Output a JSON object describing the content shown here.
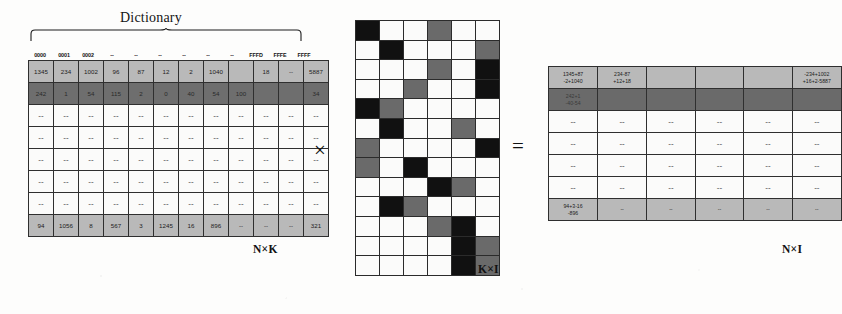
{
  "figure": {
    "dictionary_caption": "Dictionary",
    "operator_times": "×",
    "operator_equals": "="
  },
  "left_matrix": {
    "name": "code-occurrence-matrix",
    "dimension_label": "N×K",
    "column_headers": [
      "0000",
      "0001",
      "0002",
      "--",
      "--",
      "--",
      "--",
      "--",
      "--",
      "FFFD",
      "FFFE",
      "FFFF"
    ],
    "rows": [
      {
        "style": "light",
        "cells": [
          "1345",
          "234",
          "1002",
          "96",
          "87",
          "12",
          "2",
          "1040",
          "",
          "18",
          "--",
          "5887"
        ]
      },
      {
        "style": "dark",
        "cells": [
          "242",
          "1",
          "54",
          "115",
          "2",
          "0",
          "40",
          "54",
          "100",
          "",
          "",
          "34"
        ]
      },
      {
        "style": "dots",
        "cells": [
          "--",
          "--",
          "--",
          "--",
          "--",
          "--",
          "--",
          "--",
          "--",
          "--",
          "--",
          "--"
        ]
      },
      {
        "style": "dots",
        "cells": [
          "--",
          "--",
          "--",
          "--",
          "--",
          "--",
          "--",
          "--",
          "--",
          "--",
          "--",
          "--"
        ]
      },
      {
        "style": "dots",
        "cells": [
          "--",
          "--",
          "--",
          "--",
          "--",
          "--",
          "--",
          "--",
          "--",
          "--",
          "--",
          "--"
        ]
      },
      {
        "style": "dots",
        "cells": [
          "--",
          "--",
          "--",
          "--",
          "--",
          "--",
          "--",
          "--",
          "--",
          "--",
          "--",
          "--"
        ]
      },
      {
        "style": "dots",
        "cells": [
          "--",
          "--",
          "--",
          "--",
          "--",
          "--",
          "--",
          "--",
          "--",
          "--",
          "--",
          "--"
        ]
      },
      {
        "style": "light",
        "cells": [
          "94",
          "1056",
          "8",
          "567",
          "3",
          "1245",
          "16",
          "896",
          "--",
          "--",
          "--",
          "321"
        ]
      }
    ]
  },
  "middle_matrix": {
    "name": "binary-projection-matrix",
    "dimension_label": "K×I",
    "legend": {
      "white": "0",
      "black": "1",
      "gray": "shaded"
    },
    "colors": {
      "white": "#fbfbfa",
      "black": "#111111",
      "gray": "#6a6a6a"
    },
    "grid": [
      [
        "k",
        "w",
        "w",
        "g",
        "w",
        "w"
      ],
      [
        "w",
        "k",
        "w",
        "w",
        "w",
        "g"
      ],
      [
        "w",
        "w",
        "w",
        "g",
        "w",
        "k"
      ],
      [
        "w",
        "w",
        "g",
        "w",
        "w",
        "k"
      ],
      [
        "k",
        "g",
        "w",
        "w",
        "w",
        "w"
      ],
      [
        "w",
        "k",
        "w",
        "w",
        "g",
        "w"
      ],
      [
        "g",
        "w",
        "w",
        "w",
        "w",
        "k"
      ],
      [
        "g",
        "w",
        "k",
        "w",
        "w",
        "w"
      ],
      [
        "w",
        "w",
        "w",
        "k",
        "g",
        "w"
      ],
      [
        "w",
        "k",
        "g",
        "w",
        "w",
        "w"
      ],
      [
        "w",
        "w",
        "w",
        "g",
        "k",
        "w"
      ],
      [
        "w",
        "w",
        "w",
        "w",
        "k",
        "g"
      ],
      [
        "w",
        "w",
        "w",
        "w",
        "k",
        "g"
      ]
    ]
  },
  "right_matrix": {
    "name": "product-matrix",
    "dimension_label": "N×I",
    "rows": [
      {
        "style": "light",
        "cells": [
          [
            "1345+87",
            "-2+1040"
          ],
          [
            "234-87",
            "+12+18"
          ],
          [
            "",
            ""
          ],
          [
            "",
            ""
          ],
          [
            "",
            ""
          ],
          [
            "-234+1002",
            "+16+2-5887"
          ]
        ]
      },
      {
        "style": "dark",
        "cells": [
          [
            "242+1",
            "-40-54"
          ],
          [
            "",
            ""
          ],
          [
            "",
            ""
          ],
          [
            "",
            ""
          ],
          [
            "",
            ""
          ],
          [
            "",
            ""
          ]
        ]
      },
      {
        "style": "dots",
        "cells": [
          [
            "--"
          ],
          [
            "--"
          ],
          [
            "--"
          ],
          [
            "--"
          ],
          [
            "--"
          ],
          [
            "--"
          ]
        ]
      },
      {
        "style": "dots",
        "cells": [
          [
            "--"
          ],
          [
            "--"
          ],
          [
            "--"
          ],
          [
            "--"
          ],
          [
            "--"
          ],
          [
            "--"
          ]
        ]
      },
      {
        "style": "dots",
        "cells": [
          [
            "--"
          ],
          [
            "--"
          ],
          [
            "--"
          ],
          [
            "--"
          ],
          [
            "--"
          ],
          [
            "--"
          ]
        ]
      },
      {
        "style": "dots",
        "cells": [
          [
            "--"
          ],
          [
            "--"
          ],
          [
            "--"
          ],
          [
            "--"
          ],
          [
            "--"
          ],
          [
            "--"
          ]
        ]
      },
      {
        "style": "light",
        "cells": [
          [
            "94+3-16",
            "-896"
          ],
          [
            "--",
            ""
          ],
          [
            "--",
            ""
          ],
          [
            "--",
            ""
          ],
          [
            "--",
            ""
          ],
          [
            "--",
            ""
          ]
        ]
      }
    ]
  }
}
